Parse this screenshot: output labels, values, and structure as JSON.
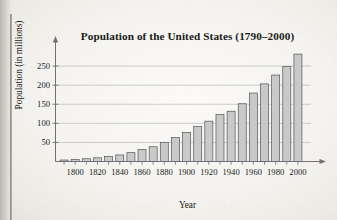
{
  "figure": {
    "title": "Population of the United States (1790–2000)",
    "xlabel": "Year",
    "ylabel": "Population (in millions)"
  },
  "colors": {
    "bar_fill": "#c9c9c9",
    "bar_stroke": "#55555a",
    "axis": "#6f6f74",
    "grid": "#b9b9bd",
    "text": "#1a1a18",
    "paper": "#f4f3ef"
  },
  "chart_data": {
    "type": "bar",
    "title": "Population of the United States (1790–2000)",
    "xlabel": "Year",
    "ylabel": "Population (in millions)",
    "categories": [
      1790,
      1800,
      1810,
      1820,
      1830,
      1840,
      1850,
      1860,
      1870,
      1880,
      1890,
      1900,
      1910,
      1920,
      1930,
      1940,
      1950,
      1960,
      1970,
      1980,
      1990,
      2000
    ],
    "values": [
      3.9,
      5.3,
      7.2,
      9.6,
      12.9,
      17.1,
      23.2,
      31.4,
      38.6,
      50.2,
      62.9,
      76.0,
      92.0,
      105.7,
      122.8,
      131.7,
      151.3,
      179.3,
      203.3,
      226.5,
      248.7,
      281.4
    ],
    "xtick_labels": [
      "1800",
      "1820",
      "1840",
      "1860",
      "1880",
      "1900",
      "1920",
      "1940",
      "1960",
      "1980",
      "2000"
    ],
    "xtick_values": [
      1800,
      1820,
      1840,
      1860,
      1880,
      1900,
      1920,
      1940,
      1960,
      1980,
      2000
    ],
    "ytick_labels": [
      "50",
      "100",
      "150",
      "200",
      "250"
    ],
    "ytick_values": [
      50,
      100,
      150,
      200,
      250
    ],
    "xlim": [
      1785,
      2008
    ],
    "ylim": [
      0,
      300
    ],
    "grid": "horizontal",
    "legend": "none",
    "axis_arrows": true
  }
}
